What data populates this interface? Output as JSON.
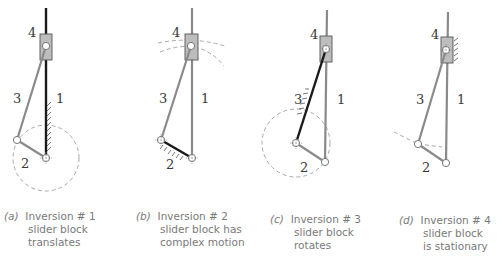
{
  "figure": {
    "panels": [
      {
        "id": "a",
        "tag": "(a)",
        "title": "Inversion # 1",
        "line2": "slider block",
        "line3": "translates",
        "labels": {
          "slider": "4",
          "coupler": "3",
          "ground": "1",
          "crank": "2"
        },
        "grounded_link": "1"
      },
      {
        "id": "b",
        "tag": "(b)",
        "title": "Inversion # 2",
        "line2": "slider block has",
        "line3": "complex motion",
        "labels": {
          "slider": "4",
          "coupler": "3",
          "ground": "1",
          "crank": "2"
        },
        "grounded_link": "2"
      },
      {
        "id": "c",
        "tag": "(c)",
        "title": "Inversion # 3",
        "line2": "slider block",
        "line3": "rotates",
        "labels": {
          "slider": "4",
          "coupler": "3",
          "ground": "1",
          "crank": "2"
        },
        "grounded_link": "3"
      },
      {
        "id": "d",
        "tag": "(d)",
        "title": "Inversion # 4",
        "line2": "slider block",
        "line3": "is stationary",
        "labels": {
          "slider": "4",
          "coupler": "3",
          "ground": "1",
          "crank": "2"
        },
        "grounded_link": "4"
      }
    ],
    "colors": {
      "link": "#8a8a8a",
      "ground_link": "#1a1a1a",
      "block_fill": "#bdbdbd",
      "block_stroke": "#555555",
      "dashed": "#a8a8a8",
      "caption": "#7a7a7a"
    }
  }
}
